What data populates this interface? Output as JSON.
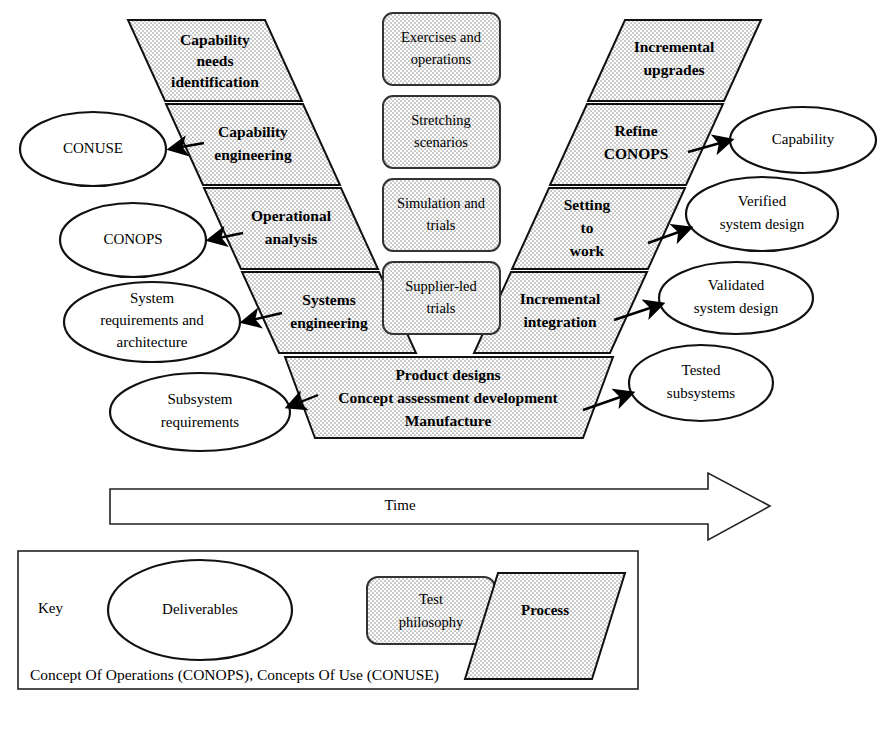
{
  "figure": {
    "time_axis_label": "Time"
  },
  "left_arm": {
    "name": "Downward (definition) arm",
    "stages": [
      {
        "id": "capability-needs-identification",
        "label_lines": [
          "Capability",
          "needs",
          "identification"
        ]
      },
      {
        "id": "capability-engineering",
        "label_lines": [
          "Capability",
          "engineering"
        ]
      },
      {
        "id": "operational-analysis",
        "label_lines": [
          "Operational",
          "analysis"
        ]
      },
      {
        "id": "systems-engineering",
        "label_lines": [
          "Systems",
          "engineering"
        ]
      }
    ]
  },
  "right_arm": {
    "name": "Upward (integration) arm",
    "stages": [
      {
        "id": "incremental-upgrades",
        "label_lines": [
          "Incremental",
          "upgrades"
        ]
      },
      {
        "id": "refine-conops",
        "label_lines": [
          "Refine",
          "CONOPS"
        ]
      },
      {
        "id": "setting-to-work",
        "label_lines": [
          "Setting",
          "to",
          "work"
        ]
      },
      {
        "id": "incremental-integration",
        "label_lines": [
          "Incremental",
          "integration"
        ]
      }
    ]
  },
  "bottom_band": {
    "id": "product-designs-band",
    "label_lines": [
      "Product designs",
      "Concept assessment development",
      "Manufacture"
    ]
  },
  "test_philosophy_boxes": [
    {
      "id": "exercises-and-operations",
      "label_lines": [
        "Exercises and",
        "operations"
      ]
    },
    {
      "id": "stretching-scenarios",
      "label_lines": [
        "Stretching",
        "scenarios"
      ]
    },
    {
      "id": "simulation-and-trials",
      "label_lines": [
        "Simulation and",
        "trials"
      ]
    },
    {
      "id": "supplier-led-trials",
      "label_lines": [
        "Supplier-led",
        "trials"
      ]
    }
  ],
  "left_deliverables": [
    {
      "id": "conuse",
      "label_lines": [
        "CONUSE"
      ]
    },
    {
      "id": "conops",
      "label_lines": [
        "CONOPS"
      ]
    },
    {
      "id": "system-requirements-and-architecture",
      "label_lines": [
        "System",
        "requirements and",
        "architecture"
      ]
    },
    {
      "id": "subsystem-requirements",
      "label_lines": [
        "Subsystem",
        "requirements"
      ]
    }
  ],
  "right_deliverables": [
    {
      "id": "capability",
      "label_lines": [
        "Capability"
      ]
    },
    {
      "id": "verified-system-design",
      "label_lines": [
        "Verified",
        "system design"
      ]
    },
    {
      "id": "validated-system-design",
      "label_lines": [
        "Validated",
        "system design"
      ]
    },
    {
      "id": "tested-subsystems",
      "label_lines": [
        "Tested",
        "subsystems"
      ]
    }
  ],
  "key": {
    "heading": "Key",
    "items": [
      {
        "id": "key-deliverables",
        "label": "Deliverables",
        "shape": "ellipse"
      },
      {
        "id": "key-test-philosophy",
        "label_lines": [
          "Test",
          "philosophy"
        ],
        "shape": "rounded-rect"
      },
      {
        "id": "key-process",
        "label": "Process",
        "shape": "parallelogram"
      }
    ],
    "footnote": "Concept Of Operations (CONOPS), Concepts Of Use (CONUSE)"
  },
  "colors": {
    "stroke": "#111111",
    "fill_pattern": "#ffffff with grey dot stipple",
    "background": "#ffffff"
  }
}
